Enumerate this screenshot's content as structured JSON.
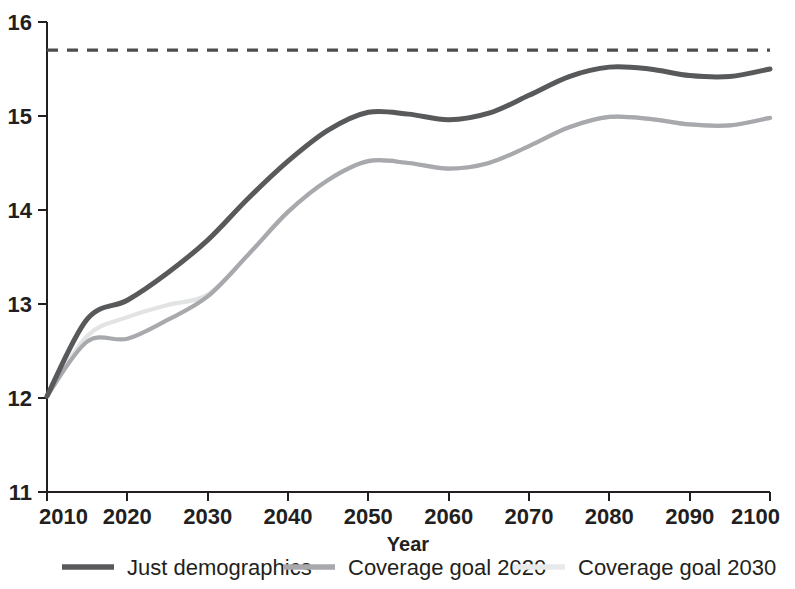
{
  "chart_data": {
    "type": "line",
    "title": "",
    "subtitle": "",
    "xlabel": "Year",
    "ylabel": "",
    "xlim": [
      2010,
      2100
    ],
    "ylim": [
      11,
      16
    ],
    "xticks": [
      2010,
      2020,
      2030,
      2040,
      2050,
      2060,
      2070,
      2080,
      2090,
      2100
    ],
    "yticks": [
      11,
      12,
      13,
      14,
      15,
      16
    ],
    "grid": false,
    "legend_position": "bottom",
    "annotations": [
      {
        "name": "reference-line",
        "type": "horizontal-dashed-line",
        "value": 15.7,
        "label": "",
        "color": "#4d4d4d",
        "dash": "11,9"
      }
    ],
    "x": [
      2010,
      2015,
      2020,
      2025,
      2030,
      2035,
      2040,
      2045,
      2050,
      2055,
      2060,
      2065,
      2070,
      2075,
      2080,
      2085,
      2090,
      2095,
      2100
    ],
    "series": [
      {
        "name": "Just demographics",
        "color": "#58595b",
        "width": 5.0,
        "values": [
          12.02,
          12.84,
          13.04,
          13.33,
          13.68,
          14.12,
          14.52,
          14.85,
          15.04,
          15.02,
          14.96,
          15.03,
          15.22,
          15.42,
          15.52,
          15.5,
          15.43,
          15.42,
          15.5
        ]
      },
      {
        "name": "Coverage goal 2020",
        "color": "#a7a9ac",
        "width": 4.2,
        "values": [
          12.02,
          12.6,
          12.63,
          12.83,
          13.08,
          13.52,
          13.98,
          14.32,
          14.52,
          14.5,
          14.44,
          14.5,
          14.68,
          14.88,
          14.99,
          14.97,
          14.91,
          14.9,
          14.98
        ]
      },
      {
        "name": "Coverage goal 2030",
        "color": "#e2e3e4",
        "width": 4.2,
        "values": [
          12.02,
          12.66,
          12.86,
          12.99,
          13.1,
          13.52,
          13.98,
          14.32,
          14.52,
          14.5,
          14.44,
          14.5,
          14.68,
          14.88,
          14.99,
          14.97,
          14.91,
          14.9,
          14.98
        ]
      }
    ],
    "legend": [
      {
        "label": "Just demographics",
        "color": "#58595b"
      },
      {
        "label": "Coverage goal 2020",
        "color": "#a7a9ac"
      },
      {
        "label": "Coverage goal 2030",
        "color": "#e8e9ea"
      }
    ]
  }
}
